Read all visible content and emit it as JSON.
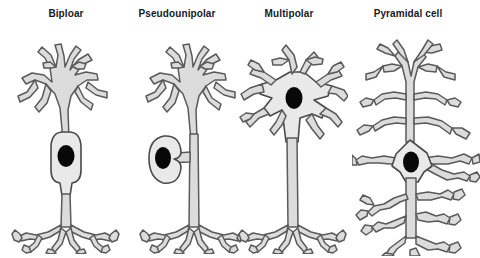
{
  "figure": {
    "title_present": false,
    "background_color": "#ffffff",
    "width": 480,
    "height": 258,
    "colors": {
      "soma_fill": "#e9e9e9",
      "process_fill": "#dcdcdc",
      "outline": "#5a5a5a",
      "soma_outline": "#4a4a4a",
      "nucleus": "#080808",
      "label_text": "#1a1a1a"
    }
  },
  "panels": [
    {
      "id": "bipolar",
      "label": "Biploar",
      "label_x": 66,
      "center_x": 63,
      "parts": [
        "dendritic-tree",
        "soma",
        "nucleus",
        "axon",
        "axon-terminals"
      ]
    },
    {
      "id": "pseudounipolar",
      "label": "Pseudounipolar",
      "label_x": 177,
      "center_x": 183,
      "parts": [
        "dendritic-tree",
        "soma",
        "nucleus",
        "stalk",
        "axon",
        "axon-terminals"
      ]
    },
    {
      "id": "multipolar",
      "label": "Multipolar",
      "label_x": 289,
      "center_x": 290,
      "parts": [
        "dendrites",
        "soma",
        "nucleus",
        "axon",
        "axon-terminals"
      ]
    },
    {
      "id": "pyramidal",
      "label": "Pyramidal cell",
      "label_x": 408,
      "center_x": 410,
      "parts": [
        "apical-dendrite",
        "oblique-dendrites",
        "soma",
        "nucleus",
        "basal-dendrites",
        "axon",
        "axon-terminals"
      ]
    }
  ]
}
